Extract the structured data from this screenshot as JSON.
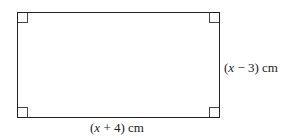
{
  "diagram": {
    "shape": "rectangle",
    "right_angle_markers": 4,
    "width_label": {
      "open": "(",
      "var": "x",
      "rest": " + 4) cm"
    },
    "height_label": {
      "open": "(",
      "var": "x",
      "rest": " − 3) cm"
    },
    "stroke_color": "#222222"
  }
}
